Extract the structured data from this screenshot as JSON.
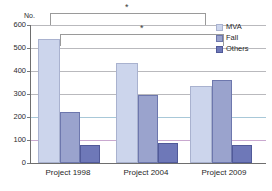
{
  "chart_data": {
    "type": "bar",
    "title": "",
    "xlabel": "",
    "ylabel": "No.",
    "ylim": [
      0,
      600
    ],
    "ytick_step": 100,
    "yticks": [
      "600",
      "500",
      "400",
      "300",
      "200",
      "100",
      "0"
    ],
    "grid": true,
    "legend_position": "top-right",
    "categories": [
      "Project 1998",
      "Project 2004",
      "Project 2009"
    ],
    "series": [
      {
        "name": "MVA",
        "values": [
          540,
          435,
          335
        ],
        "color": "#ccd5ec"
      },
      {
        "name": "Fall",
        "values": [
          220,
          295,
          360
        ],
        "color": "#9aa3cd"
      },
      {
        "name": "Others",
        "values": [
          80,
          85,
          80
        ],
        "color": "#6e78b8"
      }
    ],
    "annotations": [
      {
        "label": "*",
        "from": "Project 1998",
        "to": "Project 2009",
        "level": 1
      },
      {
        "label": "*",
        "from": "Project 1998",
        "to": "Project 2009",
        "level": 2
      }
    ]
  },
  "axis": {
    "y_title": "No.",
    "tick_600": "600",
    "tick_500": "500",
    "tick_400": "400",
    "tick_300": "300",
    "tick_200": "200",
    "tick_100": "100",
    "tick_0": "0"
  },
  "groups": {
    "g1": "Project 1998",
    "g2": "Project 2004",
    "g3": "Project 2009"
  },
  "legend": {
    "mva": "MVA",
    "fall": "Fall",
    "others": "Others"
  },
  "significance": {
    "star_top": "*",
    "star_lower": "*"
  }
}
